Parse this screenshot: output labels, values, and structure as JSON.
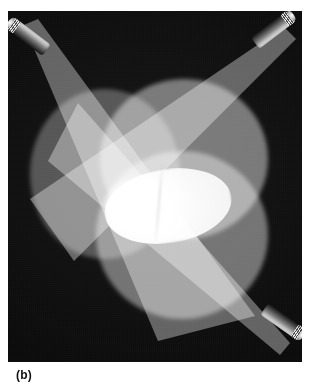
{
  "figure": {
    "caption": "(b)",
    "background_color": "#0a0a0a"
  },
  "photo": {
    "alt_description": "Three flashlight beams projected onto a dark screen, their circular spots overlapping to produce a bright white lens-shaped region at the center",
    "frame": {
      "x": 8,
      "y": 11,
      "width": 294,
      "height": 351
    }
  },
  "lamps": [
    {
      "name": "top-left-flashlight",
      "position": "top-left",
      "aim": "down-right",
      "angle_deg": 37
    },
    {
      "name": "top-right-flashlight",
      "position": "top-right",
      "aim": "down-left",
      "angle_deg": 143
    },
    {
      "name": "bottom-right-flashlight",
      "position": "bottom-right",
      "aim": "up-left",
      "angle_deg": 215
    }
  ],
  "beams": [
    {
      "name": "beam-from-top-left",
      "color": "#606060"
    },
    {
      "name": "beam-from-top-right",
      "color": "#606060"
    },
    {
      "name": "beam-from-bottom-right",
      "color": "#606060"
    }
  ],
  "spots": [
    {
      "name": "left-spot",
      "color": "#4a4a4a",
      "note": "dimmest disc, left of center"
    },
    {
      "name": "upper-spot",
      "color": "#6f6f6f",
      "note": "upper-right disc"
    },
    {
      "name": "lower-spot",
      "color": "#6a6a6a",
      "note": "lower-center disc"
    }
  ],
  "overlap": {
    "triple_overlap_color": "#ffffff",
    "double_overlap_color": "#aaaaaa",
    "single_beam_color": "#808080",
    "shape": "vesica / lens"
  },
  "icons": {
    "flashlight": "flashlight-icon"
  }
}
